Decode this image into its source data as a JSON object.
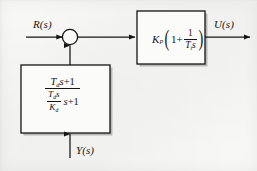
{
  "figure": {
    "kind": "control-system-block-diagram",
    "background_color": "#f7f7f5",
    "line_color": "#141414",
    "text_color": "#141414"
  },
  "signals": {
    "reference": {
      "label": "R(s)",
      "name": "reference-input"
    },
    "control": {
      "label": "U(s)",
      "name": "control-output"
    },
    "measurement": {
      "label": "Y(s)",
      "name": "measurement-input"
    }
  },
  "summing_junction": {
    "name": "summing-junction",
    "shape": "circle",
    "sign_markers": "",
    "inputs": [
      "R(s)",
      "feedback"
    ],
    "outputs": [
      "error"
    ]
  },
  "controller_block": {
    "name": "controller-block",
    "gain_symbol": "K",
    "gain_subscript": "p",
    "one_plus": "1+",
    "fraction_numerator": "1",
    "fraction_denominator_symbol": "T",
    "fraction_denominator_subscript": "i",
    "fraction_denominator_variable": "s",
    "expression_plain": "K_p(1 + 1/(T_i s))"
  },
  "feedback_block": {
    "name": "feedback-block",
    "numerator_symbol": "T",
    "numerator_subscript": "d",
    "numerator_variable": "s",
    "numerator_tail": "+1",
    "inner_numerator_symbol": "T",
    "inner_numerator_subscript": "d",
    "inner_numerator_variable": "s",
    "inner_denominator_symbol": "K",
    "inner_denominator_subscript": "d",
    "denominator_tail_variable": "s",
    "denominator_tail": "+1",
    "expression_plain": "(T_d s + 1) / ((T_d s / K_d) s + 1)"
  },
  "arrows": {
    "reference_to_sum": "right",
    "sum_to_controller": "right",
    "controller_to_output": "right",
    "feedback_to_sum": "up",
    "measurement_to_feedback": "up"
  }
}
